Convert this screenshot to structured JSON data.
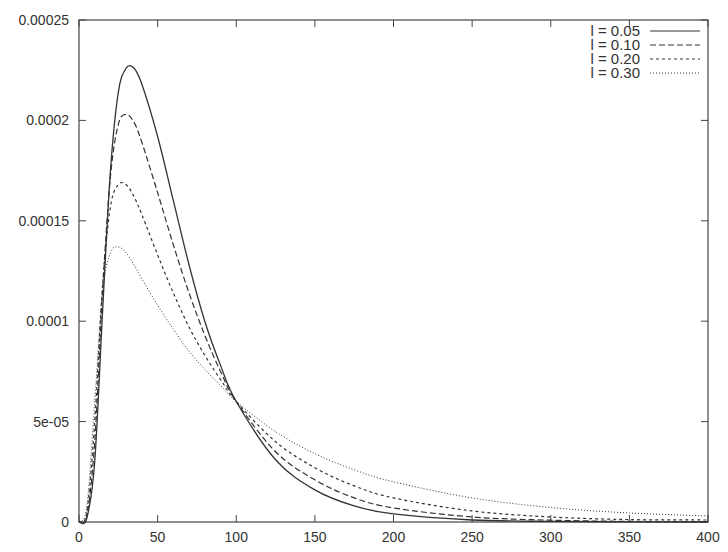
{
  "chart_data": {
    "type": "line",
    "title": "",
    "xlabel": "",
    "ylabel": "",
    "xlim": [
      0,
      400
    ],
    "ylim": [
      0,
      0.00025
    ],
    "grid": false,
    "legend_position": "top-right",
    "x_ticks": [
      0,
      50,
      100,
      150,
      200,
      250,
      300,
      350,
      400
    ],
    "x_tick_labels": [
      "0",
      "50",
      "100",
      "150",
      "200",
      "250",
      "300",
      "350",
      "400"
    ],
    "y_ticks": [
      0,
      5e-05,
      0.0001,
      0.00015,
      0.0002,
      0.00025
    ],
    "y_tick_labels": [
      "0",
      "5e-05",
      "0.0001",
      "0.00015",
      "0.0002",
      "0.00025"
    ],
    "x": [
      0,
      5,
      10,
      15,
      20,
      25,
      30,
      35,
      40,
      50,
      60,
      70,
      80,
      90,
      100,
      125,
      150,
      175,
      200,
      250,
      300,
      350,
      400
    ],
    "series": [
      {
        "name": "l = 0.05",
        "style": "solid",
        "peak": {
          "x": 33,
          "y": 0.000227
        },
        "values": [
          0,
          2e-06,
          3e-05,
          0.000105,
          0.000175,
          0.000214,
          0.000226,
          0.000226,
          0.000218,
          0.000192,
          0.00016,
          0.000128,
          0.0001,
          7.8e-05,
          6e-05,
          3.1e-05,
          1.6e-05,
          8e-06,
          4e-06,
          1e-06,
          3e-07,
          1e-07,
          0
        ]
      },
      {
        "name": "l = 0.10",
        "style": "dashed",
        "peak": {
          "x": 30,
          "y": 0.000203
        },
        "values": [
          0,
          3e-06,
          4e-05,
          0.000115,
          0.000172,
          0.000198,
          0.000203,
          0.000199,
          0.000189,
          0.000164,
          0.000138,
          0.000114,
          9.3e-05,
          7.5e-05,
          6e-05,
          3.5e-05,
          2.1e-05,
          1.2e-05,
          7e-06,
          2.5e-06,
          9e-07,
          3e-07,
          1e-07
        ]
      },
      {
        "name": "l = 0.20",
        "style": "dotted",
        "peak": {
          "x": 27,
          "y": 0.000169
        },
        "values": [
          0,
          5e-06,
          5e-05,
          0.000118,
          0.000157,
          0.000168,
          0.000168,
          0.000162,
          0.000153,
          0.000133,
          0.000114,
          9.7e-05,
          8.3e-05,
          7.1e-05,
          6e-05,
          4e-05,
          2.7e-05,
          1.8e-05,
          1.2e-05,
          5.5e-06,
          2.5e-06,
          1.2e-06,
          1e-06
        ]
      },
      {
        "name": "l = 0.30",
        "style": "fine-dotted",
        "peak": {
          "x": 24,
          "y": 0.000137
        },
        "values": [
          0,
          8e-06,
          6e-05,
          0.000115,
          0.000134,
          0.000137,
          0.000134,
          0.000128,
          0.000121,
          0.000108,
          9.6e-05,
          8.5e-05,
          7.6e-05,
          6.8e-05,
          6e-05,
          4.5e-05,
          3.4e-05,
          2.6e-05,
          2e-05,
          1.2e-05,
          7.2e-06,
          4.5e-06,
          3e-06
        ]
      }
    ]
  },
  "legend": {
    "items": [
      {
        "label": "l = 0.05",
        "dash": ""
      },
      {
        "label": "l = 0.10",
        "dash": "6,3"
      },
      {
        "label": "l = 0.20",
        "dash": "3,3"
      },
      {
        "label": "l = 0.30",
        "dash": "1,2"
      }
    ]
  },
  "colors": {
    "frame": "#444444",
    "series": "#333333",
    "text": "#333333",
    "background": "#ffffff"
  }
}
